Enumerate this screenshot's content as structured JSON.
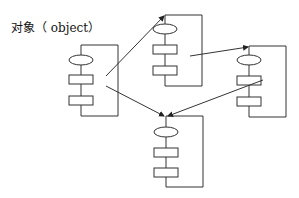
{
  "title": "对象（ object）",
  "diagram": {
    "colors": {
      "stroke": "#333333",
      "background": "#ffffff"
    },
    "objects": [
      {
        "id": "object-1",
        "frame": {
          "x": 81,
          "y": 45,
          "w": 37,
          "h": 71
        },
        "ellipse": {
          "cx": 81,
          "cy": 60,
          "rx": 12,
          "ry": 5
        },
        "rects": [
          {
            "x": 69,
            "y": 75,
            "w": 24,
            "h": 9
          },
          {
            "x": 69,
            "y": 96,
            "w": 24,
            "h": 9
          }
        ]
      },
      {
        "id": "object-2",
        "frame": {
          "x": 165,
          "y": 15,
          "w": 37,
          "h": 71
        },
        "ellipse": {
          "cx": 165,
          "cy": 29,
          "rx": 12,
          "ry": 5
        },
        "rects": [
          {
            "x": 153,
            "y": 45,
            "w": 24,
            "h": 9
          },
          {
            "x": 153,
            "y": 66,
            "w": 24,
            "h": 9
          }
        ]
      },
      {
        "id": "object-3",
        "frame": {
          "x": 249,
          "y": 46,
          "w": 37,
          "h": 71
        },
        "ellipse": {
          "cx": 249,
          "cy": 60,
          "rx": 12,
          "ry": 5
        },
        "rects": [
          {
            "x": 237,
            "y": 76,
            "w": 24,
            "h": 9
          },
          {
            "x": 237,
            "y": 97,
            "w": 24,
            "h": 9
          }
        ]
      },
      {
        "id": "object-4",
        "frame": {
          "x": 166,
          "y": 116,
          "w": 37,
          "h": 71
        },
        "ellipse": {
          "cx": 166,
          "cy": 132,
          "rx": 12,
          "ry": 5
        },
        "rects": [
          {
            "x": 154,
            "y": 148,
            "w": 24,
            "h": 9
          },
          {
            "x": 154,
            "y": 168,
            "w": 24,
            "h": 9
          }
        ]
      }
    ],
    "arrows": [
      {
        "from": "object-1",
        "to": "object-2",
        "x1": 106,
        "y1": 76,
        "x2": 164,
        "y2": 16
      },
      {
        "from": "object-2",
        "to": "object-3",
        "x1": 190,
        "y1": 56,
        "x2": 248,
        "y2": 47
      },
      {
        "from": "object-1",
        "to": "object-4",
        "x1": 106,
        "y1": 86,
        "x2": 164,
        "y2": 116
      },
      {
        "from": "object-3",
        "to": "object-4",
        "x1": 263,
        "y1": 80,
        "x2": 168,
        "y2": 116
      }
    ]
  }
}
